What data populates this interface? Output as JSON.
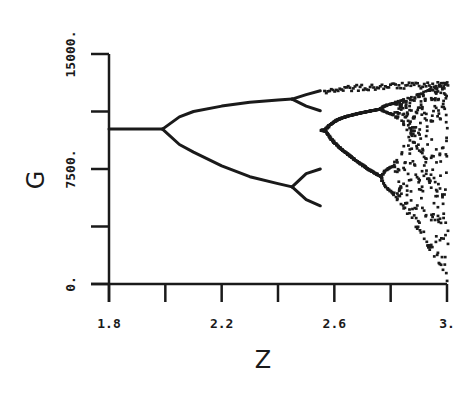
{
  "chart_data": {
    "type": "scatter",
    "title": "",
    "subtitle": "",
    "xlabel": "Z",
    "ylabel": "G",
    "xlim": [
      1.8,
      3.0
    ],
    "ylim": [
      0,
      15000
    ],
    "x_ticks": [
      1.8,
      2.0,
      2.2,
      2.4,
      2.6,
      2.8,
      3.0
    ],
    "x_tick_labels": [
      {
        "value": 1.8,
        "label": "1.8"
      },
      {
        "value": 2.2,
        "label": "2.2"
      },
      {
        "value": 2.6,
        "label": "2.6"
      },
      {
        "value": 3.0,
        "label": "3."
      }
    ],
    "y_ticks": [
      0,
      3750,
      7500,
      11250,
      15000
    ],
    "y_tick_labels": [
      {
        "value": 0,
        "label": "0."
      },
      {
        "value": 7500,
        "label": "7500."
      },
      {
        "value": 15000,
        "label": "15000."
      }
    ],
    "grid": false,
    "legend": null,
    "series": [
      {
        "name": "fixed-point",
        "x": [
          1.8,
          1.9,
          1.99
        ],
        "y": [
          10100,
          10100,
          10100
        ]
      },
      {
        "name": "period-2-upper",
        "x": [
          1.99,
          2.05,
          2.1,
          2.2,
          2.3,
          2.4,
          2.45
        ],
        "y": [
          10100,
          10900,
          11250,
          11600,
          11850,
          12000,
          12060
        ]
      },
      {
        "name": "period-2-lower",
        "x": [
          1.99,
          2.05,
          2.1,
          2.2,
          2.3,
          2.4,
          2.45
        ],
        "y": [
          10100,
          9100,
          8600,
          7700,
          7000,
          6550,
          6330
        ]
      },
      {
        "name": "period-4-branches",
        "x": [
          2.45,
          2.5,
          2.55
        ],
        "y_branches": [
          [
            12060,
            12350,
            12600
          ],
          [
            12060,
            11600,
            11300
          ],
          [
            6330,
            7200,
            7500
          ],
          [
            6330,
            5500,
            5100
          ]
        ]
      },
      {
        "name": "chaotic-envelope",
        "x": [
          2.55,
          2.6,
          2.7,
          2.8,
          2.9,
          3.0
        ],
        "y_max": [
          12700,
          12900,
          13000,
          13100,
          13150,
          13200
        ],
        "y_min": [
          4800,
          4000,
          2800,
          1800,
          800,
          0
        ]
      }
    ]
  },
  "axes": {
    "x_label": "Z",
    "y_label": "G"
  }
}
